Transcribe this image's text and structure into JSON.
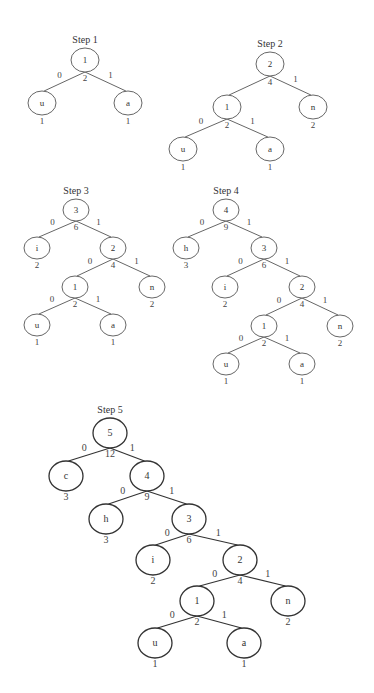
{
  "diagram": {
    "type": "huffman-tree-construction",
    "steps": [
      {
        "title": "Step 1",
        "nodes": [
          {
            "id": "r",
            "label": "1",
            "x": 85,
            "y": 60,
            "rx": 14,
            "ry": 12,
            "weight": "2"
          },
          {
            "id": "u",
            "label": "u",
            "x": 42,
            "y": 103,
            "rx": 14,
            "ry": 12,
            "weight": "1"
          },
          {
            "id": "a",
            "label": "a",
            "x": 128,
            "y": 103,
            "rx": 14,
            "ry": 12,
            "weight": "1"
          }
        ],
        "edges": [
          {
            "from": "r",
            "to": "u",
            "label": "0"
          },
          {
            "from": "r",
            "to": "a",
            "label": "1"
          }
        ]
      },
      {
        "title": "Step 2",
        "nodes": [
          {
            "id": "r",
            "label": "2",
            "x": 270,
            "y": 64,
            "rx": 14,
            "ry": 12,
            "weight": "4"
          },
          {
            "id": "n1",
            "label": "1",
            "x": 227,
            "y": 107,
            "rx": 14,
            "ry": 12,
            "weight": "2"
          },
          {
            "id": "n",
            "label": "n",
            "x": 313,
            "y": 107,
            "rx": 14,
            "ry": 12,
            "weight": "2"
          },
          {
            "id": "u",
            "label": "u",
            "x": 183,
            "y": 149,
            "rx": 14,
            "ry": 12,
            "weight": "1"
          },
          {
            "id": "a",
            "label": "a",
            "x": 270,
            "y": 149,
            "rx": 14,
            "ry": 12,
            "weight": "1"
          }
        ],
        "edges": [
          {
            "from": "r",
            "to": "n1",
            "label": ""
          },
          {
            "from": "r",
            "to": "n",
            "label": "1"
          },
          {
            "from": "n1",
            "to": "u",
            "label": "0"
          },
          {
            "from": "n1",
            "to": "a",
            "label": "1"
          }
        ]
      },
      {
        "title": "Step 3",
        "nodes": [
          {
            "id": "r",
            "label": "3",
            "x": 76,
            "y": 210,
            "rx": 13,
            "ry": 11,
            "weight": "6"
          },
          {
            "id": "i",
            "label": "i",
            "x": 37,
            "y": 248,
            "rx": 13,
            "ry": 11,
            "weight": "2"
          },
          {
            "id": "n2",
            "label": "2",
            "x": 113,
            "y": 248,
            "rx": 13,
            "ry": 11,
            "weight": "4"
          },
          {
            "id": "n1",
            "label": "1",
            "x": 75,
            "y": 287,
            "rx": 13,
            "ry": 11,
            "weight": "2"
          },
          {
            "id": "n",
            "label": "n",
            "x": 152,
            "y": 287,
            "rx": 13,
            "ry": 11,
            "weight": "2"
          },
          {
            "id": "u",
            "label": "u",
            "x": 37,
            "y": 325,
            "rx": 13,
            "ry": 11,
            "weight": "1"
          },
          {
            "id": "a",
            "label": "a",
            "x": 113,
            "y": 325,
            "rx": 13,
            "ry": 11,
            "weight": "1"
          }
        ],
        "edges": [
          {
            "from": "r",
            "to": "i",
            "label": "0"
          },
          {
            "from": "r",
            "to": "n2",
            "label": "1"
          },
          {
            "from": "n2",
            "to": "n1",
            "label": "0"
          },
          {
            "from": "n2",
            "to": "n",
            "label": "1"
          },
          {
            "from": "n1",
            "to": "u",
            "label": "0"
          },
          {
            "from": "n1",
            "to": "a",
            "label": "1"
          }
        ]
      },
      {
        "title": "Step 4",
        "nodes": [
          {
            "id": "r",
            "label": "4",
            "x": 226,
            "y": 210,
            "rx": 13,
            "ry": 11,
            "weight": "9"
          },
          {
            "id": "h",
            "label": "h",
            "x": 186,
            "y": 248,
            "rx": 13,
            "ry": 11,
            "weight": "3"
          },
          {
            "id": "n3",
            "label": "3",
            "x": 264,
            "y": 248,
            "rx": 13,
            "ry": 11,
            "weight": "6"
          },
          {
            "id": "i",
            "label": "i",
            "x": 225,
            "y": 287,
            "rx": 13,
            "ry": 11,
            "weight": "2"
          },
          {
            "id": "n2",
            "label": "2",
            "x": 302,
            "y": 287,
            "rx": 13,
            "ry": 11,
            "weight": "4"
          },
          {
            "id": "n1",
            "label": "1",
            "x": 264,
            "y": 326,
            "rx": 13,
            "ry": 11,
            "weight": "2"
          },
          {
            "id": "n",
            "label": "n",
            "x": 340,
            "y": 326,
            "rx": 13,
            "ry": 11,
            "weight": "2"
          },
          {
            "id": "u",
            "label": "u",
            "x": 226,
            "y": 364,
            "rx": 13,
            "ry": 11,
            "weight": "1"
          },
          {
            "id": "a",
            "label": "a",
            "x": 302,
            "y": 364,
            "rx": 13,
            "ry": 11,
            "weight": "1"
          }
        ],
        "edges": [
          {
            "from": "r",
            "to": "h",
            "label": "0"
          },
          {
            "from": "r",
            "to": "n3",
            "label": "1"
          },
          {
            "from": "n3",
            "to": "i",
            "label": "0"
          },
          {
            "from": "n3",
            "to": "n2",
            "label": "1"
          },
          {
            "from": "n2",
            "to": "n1",
            "label": "0"
          },
          {
            "from": "n2",
            "to": "n",
            "label": "1"
          },
          {
            "from": "n1",
            "to": "u",
            "label": "0"
          },
          {
            "from": "n1",
            "to": "a",
            "label": "1"
          }
        ]
      },
      {
        "title": "Step 5",
        "nodes": [
          {
            "id": "r",
            "label": "5",
            "x": 110,
            "y": 433,
            "rx": 17,
            "ry": 15,
            "weight": "12"
          },
          {
            "id": "c",
            "label": "c",
            "x": 66,
            "y": 476,
            "rx": 17,
            "ry": 15,
            "weight": "3"
          },
          {
            "id": "n4",
            "label": "4",
            "x": 147,
            "y": 476,
            "rx": 17,
            "ry": 15,
            "weight": "9"
          },
          {
            "id": "h",
            "label": "h",
            "x": 106,
            "y": 519,
            "rx": 17,
            "ry": 15,
            "weight": "3"
          },
          {
            "id": "n3",
            "label": "3",
            "x": 189,
            "y": 519,
            "rx": 17,
            "ry": 15,
            "weight": "6"
          },
          {
            "id": "i",
            "label": "i",
            "x": 153,
            "y": 560,
            "rx": 17,
            "ry": 15,
            "weight": "2"
          },
          {
            "id": "n2",
            "label": "2",
            "x": 240,
            "y": 560,
            "rx": 17,
            "ry": 15,
            "weight": "4"
          },
          {
            "id": "n1",
            "label": "1",
            "x": 197,
            "y": 601,
            "rx": 17,
            "ry": 15,
            "weight": "2"
          },
          {
            "id": "n",
            "label": "n",
            "x": 288,
            "y": 601,
            "rx": 17,
            "ry": 15,
            "weight": "2"
          },
          {
            "id": "u",
            "label": "u",
            "x": 155,
            "y": 643,
            "rx": 17,
            "ry": 15,
            "weight": "1"
          },
          {
            "id": "a",
            "label": "a",
            "x": 244,
            "y": 643,
            "rx": 17,
            "ry": 15,
            "weight": "1"
          }
        ],
        "edges": [
          {
            "from": "r",
            "to": "c",
            "label": "0"
          },
          {
            "from": "r",
            "to": "n4",
            "label": "1"
          },
          {
            "from": "n4",
            "to": "h",
            "label": "0"
          },
          {
            "from": "n4",
            "to": "n3",
            "label": "1"
          },
          {
            "from": "n3",
            "to": "i",
            "label": "0"
          },
          {
            "from": "n3",
            "to": "n2",
            "label": "1"
          },
          {
            "from": "n2",
            "to": "n1",
            "label": "0"
          },
          {
            "from": "n2",
            "to": "n",
            "label": "1"
          },
          {
            "from": "n1",
            "to": "u",
            "label": "0"
          },
          {
            "from": "n1",
            "to": "a",
            "label": "1"
          }
        ]
      }
    ]
  }
}
